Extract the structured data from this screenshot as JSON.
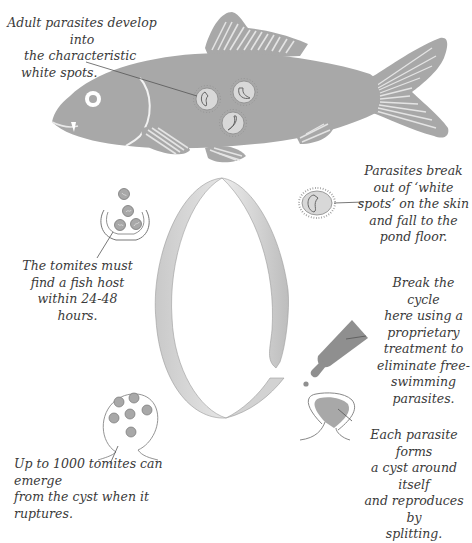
{
  "diagram": {
    "title_cut_off": "",
    "colors": {
      "fish_body": "#a8a8a8",
      "fish_fin_stripes": "#e6e6e6",
      "parasite_spot": "#d8d8d8",
      "parasite_outline": "#777777",
      "ribbon_light": "#dcdcdc",
      "ribbon_dark": "#b5b5b5",
      "bottle": "#8f8f8f",
      "leader_line": "#555555",
      "caption_text": "#3a3a3a"
    },
    "captions": {
      "adult_parasites": {
        "lines": [
          "Adult parasites develop into",
          "the characteristic",
          "white spots."
        ]
      },
      "break_out": {
        "lines": [
          "Parasites break",
          "out of ‘white",
          "spots’ on the skin",
          "and fall to the",
          "pond floor."
        ]
      },
      "tomites_host": {
        "lines": [
          "The tomites must",
          "find a fish host",
          "within 24-48",
          "hours."
        ]
      },
      "break_cycle": {
        "lines": [
          "Break the cycle",
          "here using a",
          "proprietary",
          "treatment to",
          "eliminate free-",
          "swimming",
          "parasites."
        ]
      },
      "cyst_forms": {
        "lines": [
          "Each parasite forms",
          "a cyst around itself",
          "and reproduces by",
          "splitting."
        ]
      },
      "tomites_emerge": {
        "lines": [
          "Up to 1000 tomites can emerge",
          "from the cyst when it ruptures."
        ]
      }
    },
    "icons": {
      "fish": "fish-icon",
      "white_spot": "parasite-cell-icon",
      "free_parasite": "ciliated-parasite-icon",
      "tomites_swimming": "tomites-icon",
      "treatment": "dropper-bottle-icon",
      "cyst": "cyst-icon",
      "ruptured_cyst": "ruptured-cyst-icon",
      "cycle_ribbon": "lifecycle-ribbon-icon"
    }
  }
}
